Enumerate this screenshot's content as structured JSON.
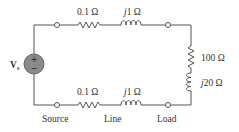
{
  "diagram": {
    "type": "circuit",
    "source": {
      "label": "V",
      "subscript": "s",
      "plus": "+",
      "minus": "−",
      "fill_color": "#8a8a8a"
    },
    "top_branch": {
      "resistor_label": "0.1 Ω",
      "inductor_label_j": "j",
      "inductor_label_val": "1 Ω"
    },
    "bottom_branch": {
      "resistor_label": "0.1 Ω",
      "inductor_label_j": "j",
      "inductor_label_val": "1 Ω"
    },
    "load": {
      "resistor_label": "100 Ω",
      "inductor_label_j": "j",
      "inductor_label_val": "20 Ω"
    },
    "section_labels": [
      "Source",
      "Line",
      "Load"
    ]
  }
}
